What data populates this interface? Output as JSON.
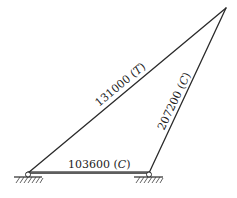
{
  "diagram": {
    "type": "truss",
    "joints": {
      "apex": {
        "x": 226,
        "y": 8
      },
      "left_support": {
        "x": 28,
        "y": 173
      },
      "right_support": {
        "x": 149,
        "y": 173
      }
    },
    "members": [
      {
        "id": "left-diagonal",
        "from": "left_support",
        "to": "apex",
        "force": "131000",
        "type": "T",
        "label": "131000 (T)"
      },
      {
        "id": "right-diagonal",
        "from": "right_support",
        "to": "apex",
        "force": "207200",
        "type": "C",
        "label": "207200 (C)"
      },
      {
        "id": "bottom-chord",
        "from": "left_support",
        "to": "right_support",
        "force": "103600",
        "type": "C",
        "label": "103600 (C)"
      }
    ],
    "supports": [
      {
        "id": "left",
        "kind": "pin"
      },
      {
        "id": "right",
        "kind": "pin"
      }
    ]
  },
  "labels": {
    "left_diagonal_value": "131000 (",
    "left_diagonal_type": "T",
    "right_diagonal_value": "207200 (",
    "right_diagonal_type": "C",
    "bottom_value": "103600 (",
    "bottom_type": "C",
    "close_paren": ")"
  },
  "colors": {
    "line": "#2a2a2a",
    "background": "#ffffff"
  }
}
